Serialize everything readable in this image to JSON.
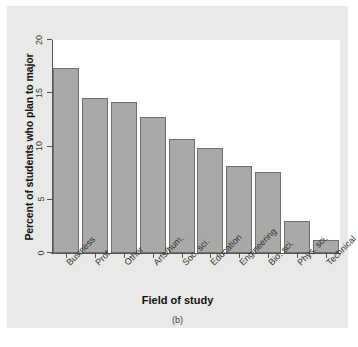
{
  "figure": {
    "caption": "(b)",
    "background_color": "#e9e9e7",
    "plot_background_color": "#ffffff",
    "bar_fill_color": "#a9a9a7",
    "bar_border_color": "#6f6f6d",
    "axis_color": "#555553"
  },
  "chart_data": {
    "type": "bar",
    "title": "",
    "subtitle": "",
    "xlabel": "Field of study",
    "ylabel": "Percent of students who plan to major",
    "categories": [
      "Business",
      "Prof.",
      "Other",
      "Arts/hum.",
      "Soc. sci.",
      "Education",
      "Engineering",
      "Bio. sci.",
      "Phys. sci.",
      "Technical"
    ],
    "values": [
      17.4,
      14.6,
      14.2,
      12.8,
      10.7,
      9.9,
      8.2,
      7.6,
      3.0,
      1.2
    ],
    "ylim": [
      0,
      20
    ],
    "yticks": [
      0,
      5,
      10,
      15,
      20
    ],
    "ytick_labels": [
      "0",
      "5",
      "10",
      "15",
      "20"
    ],
    "grid": false,
    "legend": null,
    "legend_position": "none",
    "annotations": [
      "(b)"
    ]
  }
}
